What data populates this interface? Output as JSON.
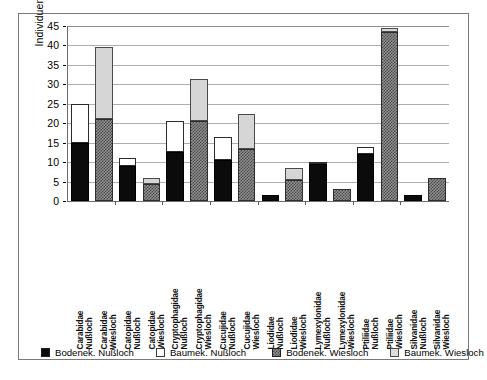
{
  "chart_data": {
    "type": "bar",
    "title": "",
    "subtitle": "",
    "xlabel": "",
    "ylabel": "Individuen",
    "ylim": [
      0,
      45
    ],
    "ytick_step": 5,
    "yticks": [
      0,
      5,
      10,
      15,
      20,
      25,
      30,
      35,
      40,
      45
    ],
    "grid": true,
    "stacked": true,
    "legend_position": "bottom",
    "orientation": "vertical",
    "xtick_label_rotation": 90,
    "categories": [
      "Carabidae Nußloch",
      "Carabidae Wiesloch",
      "Catopidae Nußloch",
      "Catopidae Wiesloch",
      "Cryptophagidae Nußloch",
      "Cryptophagidae Wiesloch",
      "Cucujidae Nußloch",
      "Cucujidae Wiesloch",
      "Liodidae Nußloch",
      "Liodidae Wiesloch",
      "Lymexylonidae Nußloch",
      "Lymexylonidae Wiesloch",
      "Ptiliidae Nußloch",
      "Ptiliidae Wiesloch",
      "Silvanidae Nußloch",
      "Silvanidae Wiesloch"
    ],
    "category_lines": [
      [
        "Carabidae",
        "Nußloch"
      ],
      [
        "Carabidae",
        "Wiesloch"
      ],
      [
        "Catopidae",
        "Nußloch"
      ],
      [
        "Catopidae",
        "Wiesloch"
      ],
      [
        "Cryptophagidae",
        "Nußloch"
      ],
      [
        "Cryptophagidae",
        "Wiesloch"
      ],
      [
        "Cucujidae",
        "Nußloch"
      ],
      [
        "Cucujidae",
        "Wiesloch"
      ],
      [
        "Liodidae",
        "Nußloch"
      ],
      [
        "Liodidae",
        "Wiesloch"
      ],
      [
        "Lymexylonidae",
        "Nußloch"
      ],
      [
        "Lymexylonidae",
        "Wiesloch"
      ],
      [
        "Ptiliidae",
        "Nußloch"
      ],
      [
        "Ptiliidae",
        "Wiesloch"
      ],
      [
        "Silvanidae",
        "Nußloch"
      ],
      [
        "Silvanidae",
        "Wiesloch"
      ]
    ],
    "series": [
      {
        "name": "Bodenek. Nußloch",
        "style": "black",
        "values": [
          15,
          0,
          9,
          0,
          12.5,
          0,
          10.5,
          0,
          1.5,
          0,
          9.5,
          0,
          12,
          0,
          1.5,
          0
        ]
      },
      {
        "name": "Baumek. Nußloch",
        "style": "white",
        "values": [
          10,
          0,
          2,
          0,
          8,
          0,
          6,
          0,
          0,
          0,
          0.5,
          0,
          2,
          0,
          0,
          0
        ]
      },
      {
        "name": "Bodenek. Wiesloch",
        "style": "dgray",
        "values": [
          0,
          21,
          0,
          4.5,
          0,
          20.5,
          0,
          13.5,
          0,
          5.5,
          0,
          3,
          0,
          43.5,
          0,
          6
        ]
      },
      {
        "name": "Baumek. Wiesloch",
        "style": "lgray",
        "values": [
          0,
          18.5,
          0,
          1.5,
          0,
          11,
          0,
          9,
          0,
          3,
          0,
          0,
          0,
          1,
          0,
          0
        ]
      }
    ],
    "totals": [
      25,
      39.5,
      11,
      6,
      20.5,
      31.5,
      16.5,
      22.5,
      1.5,
      8.5,
      10,
      3,
      14,
      44.5,
      1.5,
      6
    ]
  },
  "legend": {
    "items": [
      {
        "label": "Bodenek. Nußloch",
        "style": "black"
      },
      {
        "label": "Baumek. Nußloch",
        "style": "white"
      },
      {
        "label": "Bodenek. Wiesloch",
        "style": "dgray"
      },
      {
        "label": "Baumek. Wiesloch",
        "style": "lgray"
      }
    ]
  },
  "colors": {
    "black": "#0b0b0b",
    "white": "#ffffff",
    "dark_gray": "#8e8e8e",
    "light_gray": "#d6d6d6",
    "gridline": "#adadad",
    "axis": "#6d6d6d",
    "frame": "#7a7a7a"
  }
}
